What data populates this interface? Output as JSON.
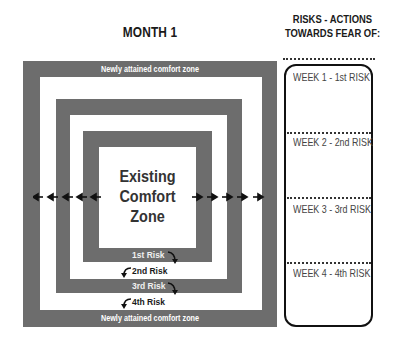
{
  "header": {
    "month_title": "MONTH 1",
    "right_title_line1": "RISKS - ACTIONS",
    "right_title_line2": "TOWARDS FEAR OF:"
  },
  "diagram": {
    "outer_top_label": "Newly attained comfort zone",
    "outer_bottom_label": "Newly attained comfort zone",
    "center_line1": "Existing",
    "center_line2": "Comfort",
    "center_line3": "Zone",
    "risks": [
      "1st Risk",
      "2nd Risk",
      "3rd Risk",
      "4th Risk"
    ],
    "arrows_left": "←",
    "arrows_right": "→",
    "band_color": "#6d6d6d"
  },
  "weeks": [
    {
      "label": "WEEK 1 - 1st RISK"
    },
    {
      "label": "WEEK 2 - 2nd RISK"
    },
    {
      "label": "WEEK 3 - 3rd RISK"
    },
    {
      "label": "WEEK 4 - 4th RISK"
    }
  ]
}
